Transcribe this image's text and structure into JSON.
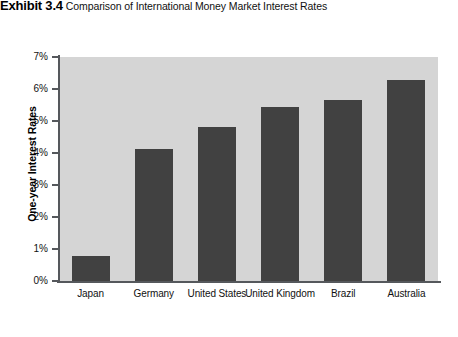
{
  "header": {
    "exhibit_label": "Exhibit 3.4",
    "caption": "Comparison of International Money Market Interest Rates"
  },
  "chart_data": {
    "type": "bar",
    "title": "Comparison of International Money Market Interest Rates",
    "xlabel": "",
    "ylabel": "One-year Interest Rates",
    "categories": [
      "Japan",
      "Germany",
      "United States",
      "United Kingdom",
      "Brazil",
      "Australia"
    ],
    "values": [
      0.78,
      4.12,
      4.81,
      5.44,
      5.66,
      6.28
    ],
    "ylim": [
      0,
      7
    ],
    "ytick_labels": [
      "7%",
      "6%",
      "5%",
      "4%",
      "3%",
      "2%",
      "1%",
      "0%"
    ],
    "ytick_values": [
      7,
      6,
      5,
      4,
      3,
      2,
      1,
      0
    ],
    "grid": false,
    "legend": "none",
    "colors": {
      "bar": "#414141",
      "plot_background": "#d5d5d5",
      "axis": "#55585c",
      "page_background": "#ffffff",
      "text": "#111111"
    }
  }
}
